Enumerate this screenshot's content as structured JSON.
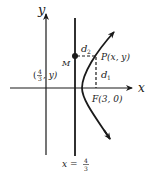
{
  "diagram": {
    "axes": {
      "x_label": "x",
      "y_label": "y"
    },
    "directrix": {
      "equation_lhs": "x =",
      "equation_num": "4",
      "equation_den": "3"
    },
    "points": {
      "M": {
        "name": "M",
        "coord_open": "(",
        "coord_num": "4",
        "coord_den": "3",
        "coord_rest": ",  y)"
      },
      "P": {
        "label": "P(x,  y)"
      },
      "F": {
        "label": "F(3,  0)"
      }
    },
    "distances": {
      "d1": {
        "base": "d",
        "sub": "1"
      },
      "d2": {
        "base": "d",
        "sub": "2"
      }
    },
    "colors": {
      "stroke": "#1a1a1a",
      "background": "#ffffff"
    }
  }
}
